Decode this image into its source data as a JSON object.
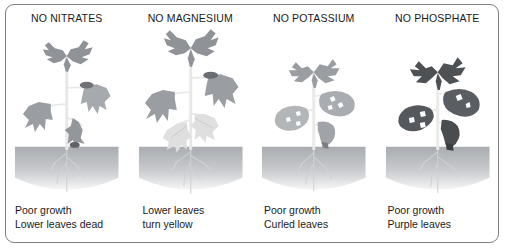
{
  "figure": {
    "kind": "plant-nutrient-deficiency-diagram",
    "border_color": "#808080",
    "background": "#ffffff",
    "leaf_colors": {
      "healthy_gray": "#8f9296",
      "light_gray": "#b9bcc0",
      "pale_yellow_gray": "#dcdedd",
      "dark_purple_gray": "#4e5154",
      "medium_gray": "#a6a9ad",
      "stem": "#e3e3e0",
      "soil_top": "#a9acb0",
      "soil_bottom": "#f2f2f2",
      "root": "#cfd1d3"
    }
  },
  "panels": [
    {
      "id": "no-nitrates",
      "title": "NO NITRATES",
      "caption_line1": "Poor growth",
      "caption_line2": "Lower leaves dead",
      "plant": {
        "height_class": "medium",
        "top_leaf_tone": "#8f9296",
        "mid_leaf_tone": "#a6a9ad",
        "low_leaf_tone": "#9a9da1",
        "stem_tone": "#e8e8e6"
      }
    },
    {
      "id": "no-magnesium",
      "title": "NO MAGNESIUM",
      "caption_line1": "Lower leaves",
      "caption_line2": "turn yellow",
      "plant": {
        "height_class": "tall",
        "top_leaf_tone": "#8f9296",
        "mid_leaf_tone": "#9a9da1",
        "low_leaf_tone": "#dedfde",
        "stem_tone": "#e8e8e6"
      }
    },
    {
      "id": "no-potassium",
      "title": "NO POTASSIUM",
      "caption_line1": "Poor growth",
      "caption_line2": "Curled leaves",
      "plant": {
        "height_class": "short",
        "top_leaf_tone": "#9a9da1",
        "mid_leaf_tone": "#a9acb0",
        "low_leaf_tone": "#b3b6b9",
        "stem_tone": "#eaeae8"
      }
    },
    {
      "id": "no-phosphate",
      "title": "NO PHOSPHATE",
      "caption_line1": "Poor growth",
      "caption_line2": "Purple leaves",
      "plant": {
        "height_class": "short",
        "top_leaf_tone": "#4e5154",
        "mid_leaf_tone": "#5a5d61",
        "low_leaf_tone": "#55585c",
        "stem_tone": "#eaeae8"
      }
    }
  ]
}
